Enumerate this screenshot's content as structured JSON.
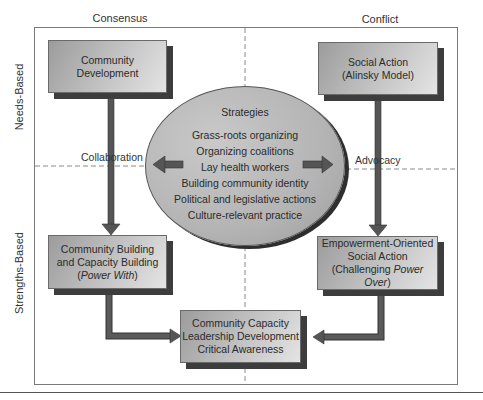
{
  "columns": {
    "left": "Consensus",
    "right": "Conflict"
  },
  "rows": {
    "top": "Needs-Based",
    "bottom": "Strengths-Based"
  },
  "boxes": {
    "top_left": {
      "lines": [
        "Community",
        "Development"
      ]
    },
    "top_right": {
      "lines": [
        "Social Action",
        "(Alinsky Model)"
      ]
    },
    "bottom_left": {
      "line1": "Community Building",
      "line2": "and Capacity Building",
      "line3_pre": "(",
      "line3_italic": "Power With",
      "line3_post": ")"
    },
    "bottom_right": {
      "line1": "Empowerment-Oriented",
      "line2": "Social Action",
      "line3_pre": "(Challenging ",
      "line3_italic": "Power Over",
      "line3_post": ")"
    },
    "bottom_center": {
      "lines": [
        "Community Capacity",
        "Leadership Development",
        "Critical Awareness"
      ]
    }
  },
  "strategies": {
    "title": "Strategies",
    "items": [
      "Grass-roots organizing",
      "Organizing coalitions",
      "Lay health workers",
      "Building community identity",
      "Political and legislative actions",
      "Culture-relevant practice"
    ]
  },
  "connectors": {
    "left": "Collaboration",
    "right": "Advocacy"
  },
  "colors": {
    "arrow": "#555555",
    "arrow_edge": "#333333",
    "shadow": "#3d3d3d",
    "frame": "#7a7a7a",
    "dash": "#8a8a8a"
  }
}
